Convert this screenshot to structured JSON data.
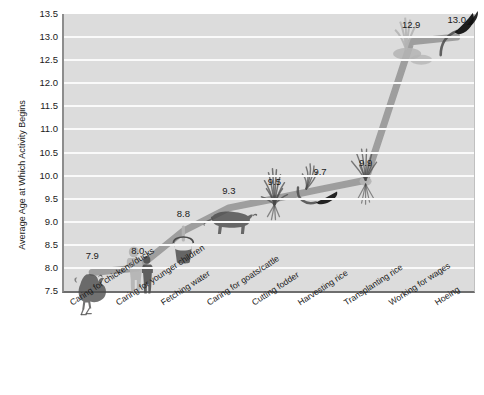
{
  "chart_data": {
    "type": "line",
    "title": "",
    "xlabel": "",
    "ylabel": "Average Age at Which Activity Begins",
    "ylim": [
      7.5,
      13.5
    ],
    "ytick_step": 0.5,
    "grid": true,
    "legend": "none",
    "yticks": [
      "13.5",
      "13.0",
      "12.5",
      "12.0",
      "11.5",
      "11.0",
      "10.5",
      "10.0",
      "9.5",
      "9.0",
      "8.5",
      "8.0",
      "7.5"
    ],
    "categories": [
      "Caring for chickens/ducks",
      "Caring for younger children",
      "Fetching water",
      "Caring for goats/cattle",
      "Cutting fodder",
      "Harvesting  rice",
      "Transplanting rice",
      "Working for wages",
      "Hoeing"
    ],
    "values": [
      7.9,
      8.0,
      8.8,
      9.3,
      9.5,
      9.7,
      9.9,
      12.9,
      13.0
    ],
    "point_labels": [
      "7.9",
      "8.0",
      "8.8",
      "9.3",
      "9.5",
      "9.7",
      "9.9",
      "12.9",
      "13.0"
    ],
    "icons": [
      "rooster-icon",
      "children-icon",
      "water-bucket-icon",
      "cattle-icon",
      "fodder-grass-icon",
      "sickle-rice-icon",
      "rice-seedling-icon",
      "rice-bundle-icon",
      "hoe-icon"
    ],
    "colors": {
      "line": "#9a9a9a",
      "plot_background": "#dcdcdc",
      "gridline": "#fafafa",
      "icon_dark": "#4a4a4a",
      "icon_light": "#b4b4b4",
      "text": "#1a1a1a",
      "axis": "#6e6e6e"
    }
  },
  "top_strip": {
    "clipped_title": ""
  }
}
